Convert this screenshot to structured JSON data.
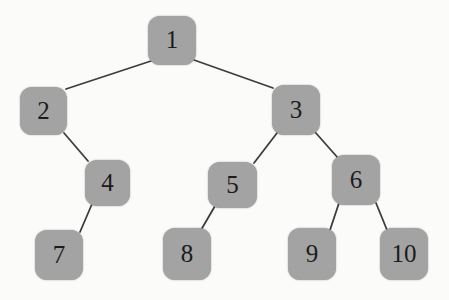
{
  "figure": {
    "type": "binary-tree-diagram",
    "background": "#fbfbfa",
    "node_fill": "#a3a3a3",
    "node_text_color": "#1c1c1c",
    "edge_color": "#3d3d3d",
    "edge_width": 1.8,
    "nodes": [
      {
        "id": "1",
        "label": "1",
        "x": 148,
        "y": 16,
        "w": 48,
        "h": 49
      },
      {
        "id": "2",
        "label": "2",
        "x": 20,
        "y": 87,
        "w": 47,
        "h": 48
      },
      {
        "id": "3",
        "label": "3",
        "x": 272,
        "y": 85,
        "w": 48,
        "h": 50
      },
      {
        "id": "4",
        "label": "4",
        "x": 85,
        "y": 160,
        "w": 45,
        "h": 46
      },
      {
        "id": "5",
        "label": "5",
        "x": 208,
        "y": 162,
        "w": 49,
        "h": 46
      },
      {
        "id": "6",
        "label": "6",
        "x": 332,
        "y": 155,
        "w": 48,
        "h": 50
      },
      {
        "id": "7",
        "label": "7",
        "x": 35,
        "y": 230,
        "w": 48,
        "h": 50
      },
      {
        "id": "8",
        "label": "8",
        "x": 163,
        "y": 228,
        "w": 48,
        "h": 52
      },
      {
        "id": "9",
        "label": "9",
        "x": 288,
        "y": 228,
        "w": 48,
        "h": 52
      },
      {
        "id": "10",
        "label": "10",
        "x": 380,
        "y": 228,
        "w": 48,
        "h": 52
      }
    ],
    "edges": [
      {
        "from": "1",
        "to": "2",
        "x1": 151,
        "y1": 61,
        "x2": 66,
        "y2": 89
      },
      {
        "from": "1",
        "to": "3",
        "x1": 194,
        "y1": 60,
        "x2": 273,
        "y2": 88
      },
      {
        "from": "2",
        "to": "4",
        "x1": 64,
        "y1": 133,
        "x2": 88,
        "y2": 161
      },
      {
        "from": "4",
        "to": "7",
        "x1": 92,
        "y1": 204,
        "x2": 80,
        "y2": 232
      },
      {
        "from": "3",
        "to": "5",
        "x1": 277,
        "y1": 133,
        "x2": 254,
        "y2": 163
      },
      {
        "from": "3",
        "to": "6",
        "x1": 315,
        "y1": 132,
        "x2": 338,
        "y2": 158
      },
      {
        "from": "5",
        "to": "8",
        "x1": 215,
        "y1": 206,
        "x2": 201,
        "y2": 230
      },
      {
        "from": "6",
        "to": "9",
        "x1": 339,
        "y1": 203,
        "x2": 330,
        "y2": 230
      },
      {
        "from": "6",
        "to": "10",
        "x1": 376,
        "y1": 203,
        "x2": 387,
        "y2": 230
      }
    ],
    "structure": {
      "root": "1",
      "children": {
        "1": {
          "left": "2",
          "right": "3"
        },
        "2": {
          "right": "4"
        },
        "3": {
          "left": "5",
          "right": "6"
        },
        "4": {
          "left": "7"
        },
        "5": {
          "left": "8"
        },
        "6": {
          "left": "9",
          "right": "10"
        }
      }
    }
  }
}
